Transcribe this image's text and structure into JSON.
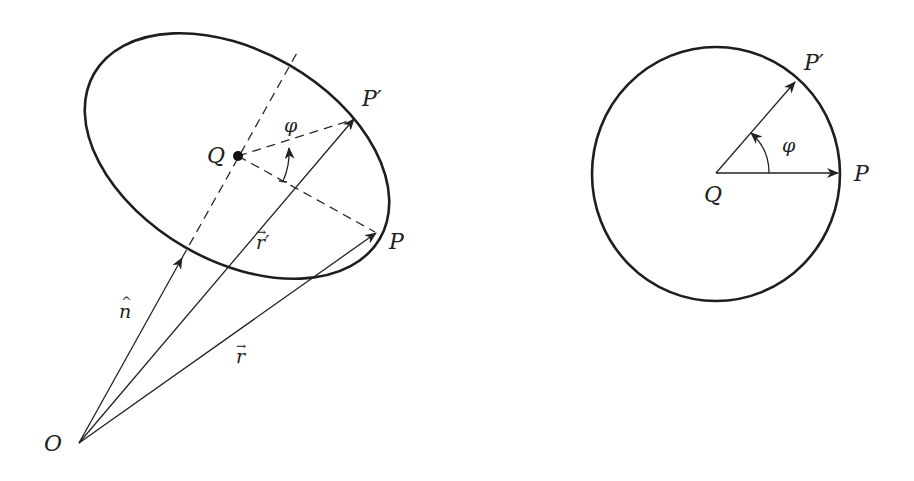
{
  "left_figure": {
    "labels": {
      "Q": "Q",
      "P_prime": "P′",
      "P": "P",
      "phi": "φ",
      "r_prime": "r′",
      "r": "r",
      "n_hat": "n",
      "O": "O"
    },
    "vector_arrow_glyph": "→",
    "hat_glyph": "^"
  },
  "right_figure": {
    "labels": {
      "Q": "Q",
      "P_prime": "P′",
      "P": "P",
      "phi": "φ"
    }
  },
  "colors": {
    "stroke": "#1e1e1e",
    "background": "#ffffff"
  }
}
